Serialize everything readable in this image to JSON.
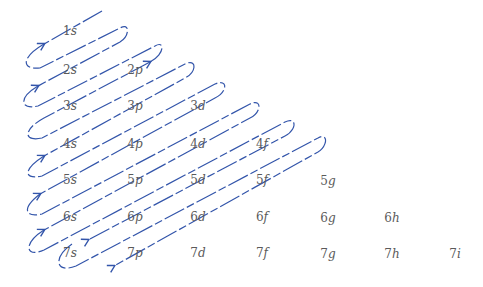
{
  "diagram": {
    "line_color": "#3355aa",
    "text_color": "#5a5a5a",
    "rows": [
      {
        "n": "1",
        "orbitals": [
          {
            "n": "1",
            "l": "s"
          }
        ]
      },
      {
        "n": "2",
        "orbitals": [
          {
            "n": "2",
            "l": "s"
          },
          {
            "n": "2",
            "l": "p"
          }
        ]
      },
      {
        "n": "3",
        "orbitals": [
          {
            "n": "3",
            "l": "s"
          },
          {
            "n": "3",
            "l": "p"
          },
          {
            "n": "3",
            "l": "d"
          }
        ]
      },
      {
        "n": "4",
        "orbitals": [
          {
            "n": "4",
            "l": "s"
          },
          {
            "n": "4",
            "l": "p"
          },
          {
            "n": "4",
            "l": "d"
          },
          {
            "n": "4",
            "l": "f"
          }
        ]
      },
      {
        "n": "5",
        "orbitals": [
          {
            "n": "5",
            "l": "s"
          },
          {
            "n": "5",
            "l": "p"
          },
          {
            "n": "5",
            "l": "d"
          },
          {
            "n": "5",
            "l": "f"
          },
          {
            "n": "5",
            "l": "g"
          }
        ]
      },
      {
        "n": "6",
        "orbitals": [
          {
            "n": "6",
            "l": "s"
          },
          {
            "n": "6",
            "l": "p"
          },
          {
            "n": "6",
            "l": "d"
          },
          {
            "n": "6",
            "l": "f"
          },
          {
            "n": "6",
            "l": "g"
          },
          {
            "n": "6",
            "l": "h"
          }
        ]
      },
      {
        "n": "7",
        "orbitals": [
          {
            "n": "7",
            "l": "s"
          },
          {
            "n": "7",
            "l": "p"
          },
          {
            "n": "7",
            "l": "d"
          },
          {
            "n": "7",
            "l": "f"
          },
          {
            "n": "7",
            "l": "g"
          },
          {
            "n": "7",
            "l": "h"
          },
          {
            "n": "7",
            "l": "i"
          }
        ]
      }
    ],
    "filling_order": [
      "1s",
      "2s",
      "2p",
      "3s",
      "3p",
      "4s",
      "3d",
      "4p",
      "5s",
      "4d",
      "5p",
      "6s",
      "4f",
      "5d",
      "6p",
      "7s",
      "5f",
      "6d",
      "7p"
    ]
  }
}
